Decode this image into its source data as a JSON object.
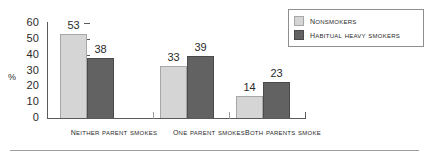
{
  "chart_data": {
    "type": "bar",
    "title": "",
    "xlabel": "",
    "ylabel": "%",
    "ylim": [
      0,
      60
    ],
    "ytick_values": [
      60,
      50,
      40,
      30,
      20,
      10,
      0
    ],
    "ytick_labels": [
      "60",
      "50",
      "40",
      "30",
      "20",
      "10",
      "0"
    ],
    "grid": false,
    "legend_position": "top-right",
    "categories": [
      "Neither parent smokes",
      "One parent smokes",
      "Both parents smoke"
    ],
    "series": [
      {
        "name": "Nonsmokers",
        "color": "#d5d5d5",
        "values": [
          53,
          33,
          14
        ],
        "labels": [
          "53",
          "33",
          "14"
        ]
      },
      {
        "name": "Habitual heavy smokers",
        "color": "#626262",
        "values": [
          38,
          39,
          23
        ],
        "labels": [
          "38",
          "39",
          "23"
        ]
      }
    ]
  },
  "legend": {
    "items": [
      {
        "label": "Nonsmokers",
        "swatch": "light"
      },
      {
        "label": "Habitual heavy smokers",
        "swatch": "dark"
      }
    ]
  },
  "axis": {
    "y_label": "%"
  }
}
